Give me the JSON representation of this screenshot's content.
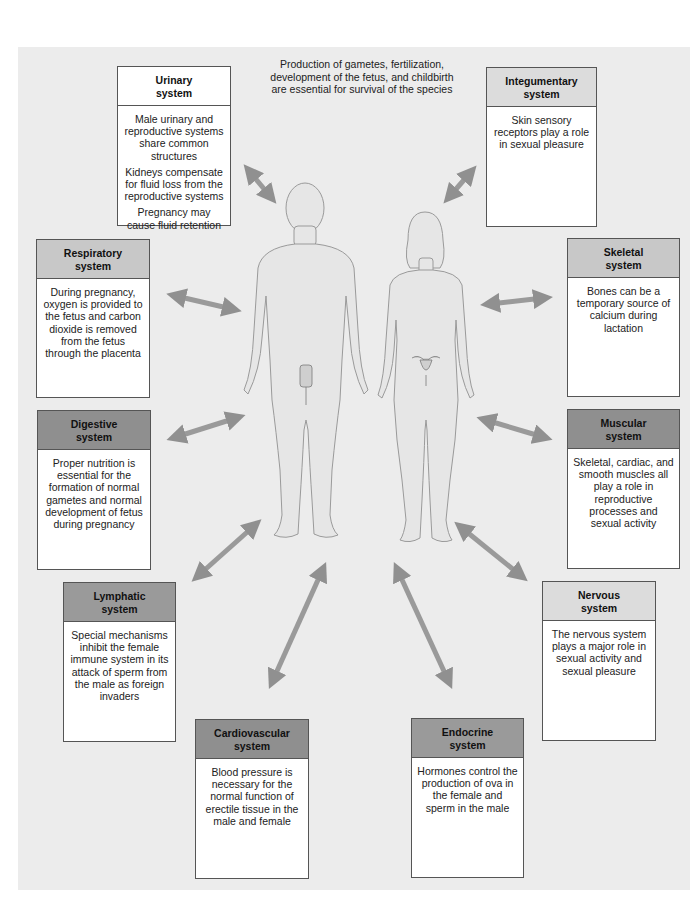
{
  "caption": {
    "lines": [
      "Production of gametes, fertilization,",
      "development of the fetus, and childbirth",
      "are essential for survival of the species"
    ]
  },
  "figures": {
    "male": "male-body-figure",
    "female": "female-body-figure"
  },
  "systems": {
    "urinary": {
      "title_1": "Urinary",
      "title_2": "system",
      "body": [
        "Male urinary and reproductive systems share common structures",
        "Kidneys compensate for fluid loss from the reproductive systems",
        "Pregnancy may cause fluid retention"
      ]
    },
    "integumentary": {
      "title_1": "Integumentary",
      "title_2": "system",
      "body": [
        "Skin sensory receptors play a role in sexual pleasure"
      ]
    },
    "respiratory": {
      "title_1": "Respiratory",
      "title_2": "system",
      "body": [
        "During pregnancy, oxygen is provided to the fetus and carbon dioxide is removed from the fetus through the placenta"
      ]
    },
    "skeletal": {
      "title_1": "Skeletal",
      "title_2": "system",
      "body": [
        "Bones can be a temporary source of calcium during lactation"
      ]
    },
    "digestive": {
      "title_1": "Digestive",
      "title_2": "system",
      "body": [
        "Proper nutrition is essential for the formation of normal gametes and normal development of fetus during pregnancy"
      ]
    },
    "muscular": {
      "title_1": "Muscular",
      "title_2": "system",
      "body": [
        "Skeletal, cardiac, and smooth muscles all play a role in reproductive processes and sexual activity"
      ]
    },
    "lymphatic": {
      "title_1": "Lymphatic",
      "title_2": "system",
      "body": [
        "Special mechanisms inhibit the female immune system in its attack of sperm from the male as foreign invaders"
      ]
    },
    "nervous": {
      "title_1": "Nervous",
      "title_2": "system",
      "body": [
        "The nervous system plays a major role in sexual activity and sexual pleasure"
      ]
    },
    "cardiovascular": {
      "title_1": "Cardiovascular",
      "title_2": "system",
      "body": [
        "Blood pressure is necessary for the normal function of erectile tissue in the male and female"
      ]
    },
    "endocrine": {
      "title_1": "Endocrine",
      "title_2": "system",
      "body": [
        "Hormones control the production of ova in the female and sperm in the male"
      ]
    }
  },
  "colors": {
    "panel": "#ececec",
    "arrow": "#8a8a8a",
    "body_fill": "#e6e6e6",
    "body_stroke": "#9a9a9a"
  }
}
